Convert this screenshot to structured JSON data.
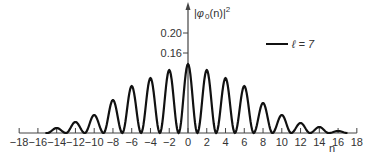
{
  "chart_data": {
    "type": "line",
    "title": "",
    "xlabel": "n",
    "ylabel": "|φ 0(n)|²",
    "ylabel_parts": {
      "phi": "φ",
      "sub": "0",
      "arg": "(n)",
      "exp": "2"
    },
    "xlim": [
      -18,
      18
    ],
    "ylim": [
      0,
      0.24
    ],
    "x_ticks": [
      -18,
      -16,
      -14,
      -12,
      -10,
      -8,
      -6,
      -4,
      -2,
      0,
      2,
      4,
      6,
      8,
      10,
      12,
      14,
      16,
      18
    ],
    "y_ticks": [
      0.16,
      0.2
    ],
    "y_tick_labels": [
      "0.16",
      "0.20"
    ],
    "grid": false,
    "legend": {
      "position": "upper right",
      "entries": [
        {
          "label": "ℓ = 7"
        }
      ]
    },
    "series": [
      {
        "name": "ℓ = 7",
        "peaks_x": [
          -14,
          -12,
          -10,
          -8,
          -6,
          -4,
          -2,
          0,
          2,
          4,
          6,
          8,
          10,
          12,
          14,
          16
        ],
        "peaks_y": [
          0.01,
          0.022,
          0.036,
          0.066,
          0.094,
          0.11,
          0.126,
          0.138,
          0.126,
          0.11,
          0.094,
          0.06,
          0.036,
          0.02,
          0.012,
          0.004
        ]
      }
    ]
  },
  "legend_label": "ℓ = 7",
  "x_axis_label": "n"
}
